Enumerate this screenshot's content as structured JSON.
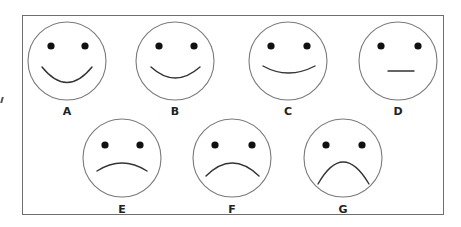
{
  "figure": {
    "colors": {
      "outline": "#7a7a7a",
      "eyes": "#111111",
      "mouth": "#333333",
      "frame": "#6e6e6e"
    },
    "faces": [
      {
        "label": "A",
        "expression": "very-happy"
      },
      {
        "label": "B",
        "expression": "happy"
      },
      {
        "label": "C",
        "expression": "slightly-happy"
      },
      {
        "label": "D",
        "expression": "neutral"
      },
      {
        "label": "E",
        "expression": "slightly-sad"
      },
      {
        "label": "F",
        "expression": "sad"
      },
      {
        "label": "G",
        "expression": "very-sad"
      }
    ]
  }
}
